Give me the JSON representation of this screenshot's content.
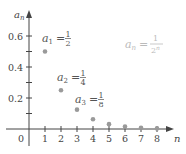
{
  "chart_data": {
    "type": "scatter",
    "title": "",
    "xlabel": "n",
    "ylabel": "a_n",
    "xlim": [
      0,
      9
    ],
    "ylim": [
      0,
      0.7
    ],
    "grid": false,
    "x_ticks": [
      "0",
      "1",
      "2",
      "3",
      "4",
      "5",
      "6",
      "7",
      "8"
    ],
    "y_ticks": [
      "0.2",
      "0.4",
      "0.6"
    ],
    "y_minor_ticks": [
      0.1,
      0.3,
      0.5
    ],
    "series": [
      {
        "name": "a_n = 1/2^n",
        "x": [
          1,
          2,
          3,
          4,
          5,
          6,
          7,
          8
        ],
        "values": [
          0.5,
          0.25,
          0.125,
          0.0625,
          0.03125,
          0.015625,
          0.0078125,
          0.00390625
        ]
      }
    ],
    "annotations": [
      {
        "var": "a",
        "sub": "1",
        "num": "1",
        "den": "2"
      },
      {
        "var": "a",
        "sub": "2",
        "num": "1",
        "den": "4"
      },
      {
        "var": "a",
        "sub": "3",
        "num": "1",
        "den": "8"
      }
    ],
    "formula": {
      "lhs_var": "a",
      "lhs_sub": "n",
      "eq": "=",
      "num": "1",
      "den_base": "2",
      "den_exp": "n"
    },
    "colors": {
      "axis": "#444444",
      "points": "#9a9a9a",
      "formula": "#bbbbbb"
    }
  },
  "axes": {
    "x_title": "n",
    "y_title_var": "a",
    "y_title_sub": "n"
  }
}
